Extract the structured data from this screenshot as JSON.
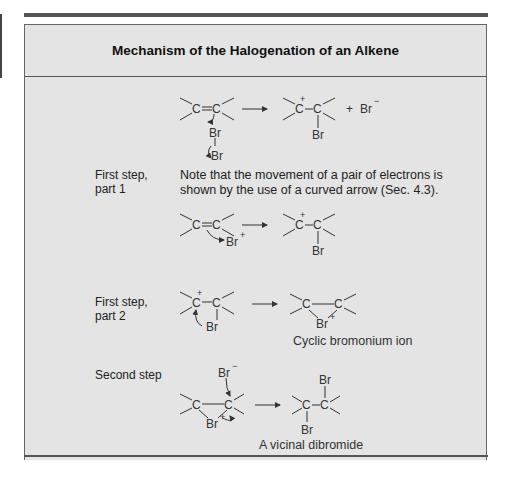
{
  "title": "Mechanism of the Halogenation of an Alkene",
  "overview": {
    "reactant": "C=C",
    "reagent": [
      "Br",
      "Br"
    ],
    "product": "C+–C(Br)",
    "plus": "+",
    "byproduct": "Br",
    "byproduct_charge": "−"
  },
  "step1": {
    "label_line1": "First step,",
    "label_line2": "part 1",
    "note_line1": "Note that the movement of a pair of electrons is",
    "note_line2": "shown by the use of a curved arrow (Sec. 4.3).",
    "reagent": "Br",
    "reagent_charge": "+",
    "product_substituent": "Br"
  },
  "step2": {
    "label_line1": "First step,",
    "label_line2": "part 2",
    "reactant_substituent": "Br",
    "product_bridge": "Br",
    "product_charge": "+",
    "caption": "Cyclic bromonium ion"
  },
  "step3": {
    "label": "Second step",
    "nucleophile": "Br",
    "nucleophile_charge": "−",
    "bridge": "Br",
    "bridge_charge": "+",
    "product_top": "Br",
    "product_bottom": "Br",
    "caption": "A vicinal dibromide"
  },
  "atoms": {
    "carbon": "C",
    "carbocation_charge": "+"
  },
  "colors": {
    "panel_bg": "#e4e4e4",
    "rule": "#555555",
    "text": "#222222"
  }
}
